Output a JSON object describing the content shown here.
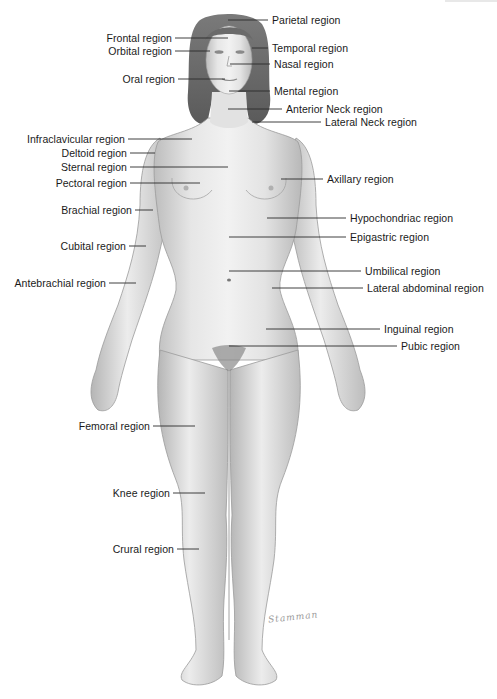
{
  "diagram": {
    "signature": "Stamman",
    "colors": {
      "text": "#1a1a1a",
      "leader": "#2a2a2a",
      "skin_light": "#ededed",
      "skin_mid": "#d2d2d2",
      "skin_dark": "#a8a8a8",
      "hair": "#6e6e6e"
    },
    "labels_left": [
      {
        "text": "Frontal region",
        "x": 172,
        "y": 38,
        "line_to": 228
      },
      {
        "text": "Orbital region",
        "x": 172,
        "y": 51,
        "line_to": 210
      },
      {
        "text": "Oral region",
        "x": 175,
        "y": 79,
        "line_to": 225
      },
      {
        "text": "Infraclavicular region",
        "x": 125,
        "y": 139,
        "line_to": 192
      },
      {
        "text": "Deltoid region",
        "x": 127,
        "y": 153,
        "line_to": 155
      },
      {
        "text": "Sternal region",
        "x": 127,
        "y": 167,
        "line_to": 228
      },
      {
        "text": "Pectoral region",
        "x": 127,
        "y": 183,
        "line_to": 200
      },
      {
        "text": "Brachial region",
        "x": 132,
        "y": 210,
        "line_to": 153
      },
      {
        "text": "Cubital region",
        "x": 126,
        "y": 246,
        "line_to": 146
      },
      {
        "text": "Antebrachial region",
        "x": 106,
        "y": 283,
        "line_to": 136
      },
      {
        "text": "Femoral region",
        "x": 150,
        "y": 426,
        "line_to": 195
      },
      {
        "text": "Knee region",
        "x": 170,
        "y": 493,
        "line_to": 205
      },
      {
        "text": "Crural region",
        "x": 174,
        "y": 549,
        "line_to": 199
      }
    ],
    "labels_right": [
      {
        "text": "Parietal region",
        "x": 272,
        "y": 20,
        "line_from": 228
      },
      {
        "text": "Temporal region",
        "x": 272,
        "y": 48,
        "line_from": 252
      },
      {
        "text": "Nasal region",
        "x": 274,
        "y": 64,
        "line_from": 230
      },
      {
        "text": "Mental region",
        "x": 274,
        "y": 91,
        "line_from": 229
      },
      {
        "text": "Anterior Neck region",
        "x": 286,
        "y": 109,
        "line_from": 228
      },
      {
        "text": "Lateral Neck region",
        "x": 325,
        "y": 122,
        "line_from": 252
      },
      {
        "text": "Axillary region",
        "x": 327,
        "y": 179,
        "line_from": 281
      },
      {
        "text": "Hypochondriac region",
        "x": 350,
        "y": 218,
        "line_from": 267
      },
      {
        "text": "Epigastric region",
        "x": 350,
        "y": 237,
        "line_from": 229
      },
      {
        "text": "Umbilical region",
        "x": 365,
        "y": 271,
        "line_from": 229
      },
      {
        "text": "Lateral abdominal region",
        "x": 367,
        "y": 288,
        "line_from": 272
      },
      {
        "text": "Inguinal region",
        "x": 384,
        "y": 329,
        "line_from": 266
      },
      {
        "text": "Pubic region",
        "x": 401,
        "y": 346,
        "line_from": 229
      }
    ]
  }
}
